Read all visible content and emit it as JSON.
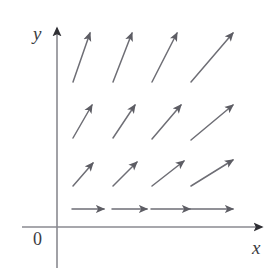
{
  "figure": {
    "name": "direction-field-plot",
    "width": 278,
    "height": 273,
    "background_color": "#ffffff"
  },
  "axes": {
    "x_label": "x",
    "y_label": "y",
    "origin_label": "0",
    "color": "#8a8a90",
    "stroke_width": 1.6,
    "arrowhead_color": "#2f2f34",
    "x_axis": {
      "x1": 22,
      "y1": 227,
      "x2": 262,
      "y2": 227
    },
    "y_axis": {
      "x1": 57,
      "y1": 268,
      "x2": 57,
      "y2": 28
    }
  },
  "chart_data": {
    "type": "scatter",
    "title": "",
    "xlabel": "x",
    "ylabel": "y",
    "grid": false,
    "legend": null,
    "arrow_color": "#6e6e75",
    "arrow_stroke_width": 1.5,
    "arrows": [
      {
        "row": 1,
        "col": 1,
        "x1": 73,
        "y1": 82,
        "x2": 90,
        "y2": 33,
        "angle_deg": 70.8
      },
      {
        "row": 1,
        "col": 2,
        "x1": 113,
        "y1": 82,
        "x2": 132,
        "y2": 33,
        "angle_deg": 68.8
      },
      {
        "row": 1,
        "col": 3,
        "x1": 152,
        "y1": 82,
        "x2": 177,
        "y2": 33,
        "angle_deg": 63.0
      },
      {
        "row": 1,
        "col": 4,
        "x1": 191,
        "y1": 82,
        "x2": 233,
        "y2": 33,
        "angle_deg": 49.4
      },
      {
        "row": 2,
        "col": 1,
        "x1": 73,
        "y1": 138,
        "x2": 92,
        "y2": 105,
        "angle_deg": 60.1
      },
      {
        "row": 2,
        "col": 2,
        "x1": 113,
        "y1": 138,
        "x2": 135,
        "y2": 105,
        "angle_deg": 56.3
      },
      {
        "row": 2,
        "col": 3,
        "x1": 152,
        "y1": 139,
        "x2": 181,
        "y2": 105,
        "angle_deg": 49.5
      },
      {
        "row": 2,
        "col": 4,
        "x1": 191,
        "y1": 140,
        "x2": 233,
        "y2": 105,
        "angle_deg": 39.8
      },
      {
        "row": 3,
        "col": 1,
        "x1": 73,
        "y1": 186,
        "x2": 93,
        "y2": 163,
        "angle_deg": 49.0
      },
      {
        "row": 3,
        "col": 2,
        "x1": 113,
        "y1": 186,
        "x2": 137,
        "y2": 162,
        "angle_deg": 45.0
      },
      {
        "row": 3,
        "col": 3,
        "x1": 152,
        "y1": 186,
        "x2": 184,
        "y2": 161,
        "angle_deg": 38.0
      },
      {
        "row": 3,
        "col": 4,
        "x1": 191,
        "y1": 186,
        "x2": 233,
        "y2": 160,
        "angle_deg": 31.8
      },
      {
        "row": 4,
        "col": 1,
        "x1": 72,
        "y1": 209,
        "x2": 104,
        "y2": 209,
        "angle_deg": 0
      },
      {
        "row": 4,
        "col": 2,
        "x1": 112,
        "y1": 209,
        "x2": 147,
        "y2": 209,
        "angle_deg": 0
      },
      {
        "row": 4,
        "col": 3,
        "x1": 151,
        "y1": 209,
        "x2": 190,
        "y2": 209,
        "angle_deg": 0
      },
      {
        "row": 4,
        "col": 4,
        "x1": 190,
        "y1": 209,
        "x2": 233,
        "y2": 209,
        "angle_deg": 0
      }
    ]
  }
}
